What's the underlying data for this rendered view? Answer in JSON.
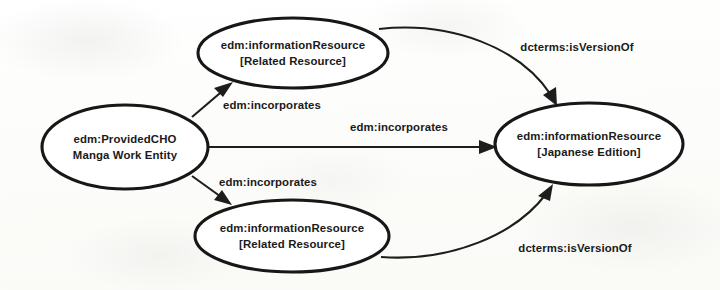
{
  "diagram": {
    "type": "entity-relationship-graph",
    "background_color": "#fdfdfc",
    "stroke_color": "#171717",
    "text_color": "#1a1a1a",
    "nodes": [
      {
        "id": "related-resource-top",
        "shape": "ellipse",
        "line1": "edm:informationResource",
        "line2": "[Related Resource]",
        "cx": 293,
        "cy": 53,
        "rx": 95,
        "ry": 35
      },
      {
        "id": "provided-cho",
        "shape": "ellipse",
        "line1": "edm:ProvidedCHO",
        "line2": "Manga Work Entity",
        "cx": 125,
        "cy": 147,
        "rx": 83,
        "ry": 42
      },
      {
        "id": "japanese-edition",
        "shape": "ellipse",
        "line1": "edm:informationResource",
        "line2": "[Japanese Edition]",
        "cx": 589,
        "cy": 144,
        "rx": 94,
        "ry": 41
      },
      {
        "id": "related-resource-bottom",
        "shape": "ellipse",
        "line1": "edm:informationResource",
        "line2": "[Related Resource]",
        "cx": 292,
        "cy": 236,
        "rx": 97,
        "ry": 36
      }
    ],
    "edges": [
      {
        "id": "cho-to-top-related",
        "label": "edm:incorporates",
        "from": "provided-cho",
        "to": "related-resource-top",
        "label_x": 272,
        "label_y": 106
      },
      {
        "id": "cho-to-japanese",
        "label": "edm:incorporates",
        "from": "provided-cho",
        "to": "japanese-edition",
        "label_x": 399,
        "label_y": 128
      },
      {
        "id": "cho-to-bottom-related",
        "label": "edm:incorporates",
        "from": "provided-cho",
        "to": "related-resource-bottom",
        "label_x": 268,
        "label_y": 183
      },
      {
        "id": "top-related-to-japanese",
        "label": "dcterms:isVersionOf",
        "from": "related-resource-top",
        "to": "japanese-edition",
        "label_x": 577,
        "label_y": 48
      },
      {
        "id": "bottom-related-to-japanese",
        "label": "dcterms:isVersionOf",
        "from": "related-resource-bottom",
        "to": "japanese-edition",
        "label_x": 575,
        "label_y": 249
      }
    ]
  }
}
